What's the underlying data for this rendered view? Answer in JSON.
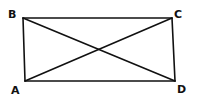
{
  "diagram": {
    "type": "rectangle-with-diagonals",
    "stroke_color": "#111111",
    "background_color": "#ffffff",
    "vertices": [
      {
        "label": "A",
        "x": 25,
        "y": 81,
        "label_x": 11,
        "label_y": 94
      },
      {
        "label": "B",
        "x": 23,
        "y": 18,
        "label_x": 8,
        "label_y": 18
      },
      {
        "label": "C",
        "x": 172,
        "y": 18,
        "label_x": 174,
        "label_y": 18
      },
      {
        "label": "D",
        "x": 175,
        "y": 81,
        "label_x": 177,
        "label_y": 93
      }
    ],
    "edges": [
      {
        "from": "B",
        "to": "C",
        "kind": "side"
      },
      {
        "from": "C",
        "to": "D",
        "kind": "side"
      },
      {
        "from": "D",
        "to": "A",
        "kind": "side"
      },
      {
        "from": "A",
        "to": "B",
        "kind": "side"
      },
      {
        "from": "B",
        "to": "D",
        "kind": "diagonal"
      },
      {
        "from": "A",
        "to": "C",
        "kind": "diagonal"
      }
    ],
    "labels": {
      "a": "A",
      "b": "B",
      "c": "C",
      "d": "D"
    }
  }
}
